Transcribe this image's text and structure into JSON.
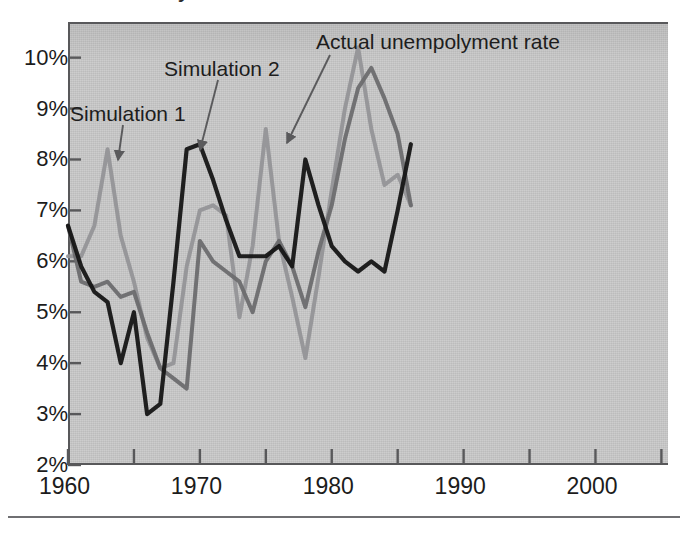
{
  "figure": {
    "clipped_title_fragment": "y",
    "background_color": "#ffffff",
    "plot_background_color": "#c9c9c9",
    "axis_color": "#58585a"
  },
  "axes": {
    "y_tick_labels": [
      "10%",
      "9%",
      "8%",
      "7%",
      "6%",
      "5%",
      "4%",
      "3%",
      "2%"
    ],
    "y_values": [
      10,
      9,
      8,
      7,
      6,
      5,
      4,
      3,
      2
    ],
    "x_tick_labels": [
      "1960",
      "1970",
      "1980",
      "1990",
      "2000"
    ],
    "x_values": [
      1960,
      1970,
      1980,
      1990,
      2000
    ],
    "x_minor_values": [
      1965,
      1975,
      1985,
      1995,
      2005
    ]
  },
  "annotations": [
    {
      "name": "simulation-1",
      "label": "Simulation 1",
      "x": 70,
      "y": 102
    },
    {
      "name": "simulation-2",
      "label": "Simulation 2",
      "x": 164,
      "y": 57
    },
    {
      "name": "actual-unemployment",
      "label": "Actual unempolyment rate",
      "x": 316,
      "y": 30
    }
  ],
  "chart_data": {
    "type": "line",
    "title": "",
    "xlabel": "",
    "ylabel": "",
    "xlim": [
      1960,
      2005.5
    ],
    "ylim": [
      2,
      10.7
    ],
    "grid": false,
    "legend": "annotated-arrows",
    "series": [
      {
        "name": "Actual unempolyment rate",
        "color": "#141414",
        "width": 4.2,
        "x": [
          1960,
          1961,
          1962,
          1963,
          1964,
          1965,
          1966,
          1967,
          1968,
          1969,
          1970,
          1971,
          1972,
          1973,
          1974,
          1975,
          1976,
          1977,
          1978,
          1979,
          1980,
          1981,
          1982,
          1983,
          1984,
          1985,
          1986
        ],
        "values": [
          6.7,
          5.9,
          5.4,
          5.2,
          4.0,
          5.0,
          3.0,
          3.2,
          5.6,
          8.2,
          8.3,
          7.6,
          6.8,
          6.1,
          6.1,
          6.1,
          6.3,
          5.9,
          8.0,
          7.1,
          6.3,
          6.0,
          5.8,
          6.0,
          5.8,
          7.0,
          8.3
        ]
      },
      {
        "name": "Simulation 2",
        "color": "#6b6b6d",
        "width": 4.0,
        "x": [
          1960,
          1961,
          1962,
          1963,
          1964,
          1965,
          1966,
          1967,
          1968,
          1969,
          1970,
          1971,
          1972,
          1973,
          1974,
          1975,
          1976,
          1977,
          1978,
          1979,
          1980,
          1981,
          1982,
          1983,
          1984,
          1985,
          1986
        ],
        "values": [
          6.7,
          5.6,
          5.5,
          5.6,
          5.3,
          5.4,
          4.6,
          3.9,
          3.7,
          3.5,
          6.4,
          6.0,
          5.8,
          5.6,
          5.0,
          6.0,
          6.4,
          5.9,
          5.1,
          6.2,
          7.1,
          8.4,
          9.4,
          9.8,
          9.2,
          8.5,
          7.1
        ]
      },
      {
        "name": "Simulation 1",
        "color": "#949497",
        "width": 4.0,
        "x": [
          1960,
          1961,
          1962,
          1963,
          1964,
          1965,
          1966,
          1967,
          1968,
          1969,
          1970,
          1971,
          1972,
          1973,
          1974,
          1975,
          1976,
          1977,
          1978,
          1979,
          1980,
          1981,
          1982,
          1983,
          1984,
          1985,
          1986
        ],
        "values": [
          6.1,
          6.1,
          6.7,
          8.2,
          6.5,
          5.6,
          4.5,
          3.9,
          4.0,
          5.9,
          7.0,
          7.1,
          6.9,
          4.9,
          6.3,
          8.6,
          6.4,
          5.3,
          4.1,
          5.7,
          7.4,
          9.0,
          10.2,
          8.6,
          7.5,
          7.7,
          7.1
        ]
      }
    ]
  }
}
